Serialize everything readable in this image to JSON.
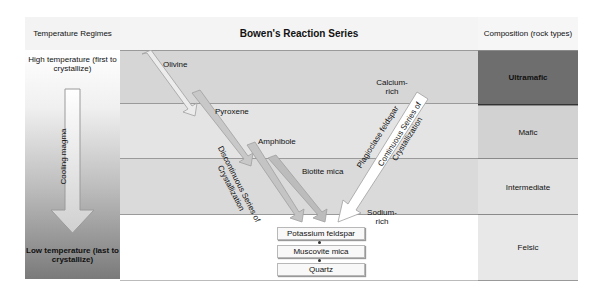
{
  "headers": {
    "left": "Temperature Regimes",
    "middle": "Bowen's Reaction Series",
    "right": "Composition (rock types)"
  },
  "temperature": {
    "high": "High temperature (first to crystallize)",
    "low": "Low temperature (last to crystallize)",
    "arrow_label": "Cooling magma"
  },
  "composition": [
    {
      "label": "Ultramafic",
      "color": "#6e6e6e"
    },
    {
      "label": "Mafic",
      "color": "#d2d2d2"
    },
    {
      "label": "Intermediate",
      "color": "#e2e2e2"
    },
    {
      "label": "Felsic",
      "color": "#e8e8e8"
    }
  ],
  "discontinuous": {
    "label": "Discontinuous Series of Crystallization",
    "minerals": [
      "Olivine",
      "Pyroxene",
      "Amphibole",
      "Biotite mica"
    ]
  },
  "continuous": {
    "label": "Continuous Series of Crystallization",
    "arrow_label": "Plagioclase feldspar",
    "top": "Calcium-rich",
    "bottom": "Sodium-rich"
  },
  "final_minerals": [
    "Potassium feldspar",
    "Muscovite mica",
    "Quartz"
  ],
  "colors": {
    "row1": "#d6d6d6",
    "row2": "#e4e4e4",
    "row3": "#dadada",
    "row4": "#ffffff"
  }
}
